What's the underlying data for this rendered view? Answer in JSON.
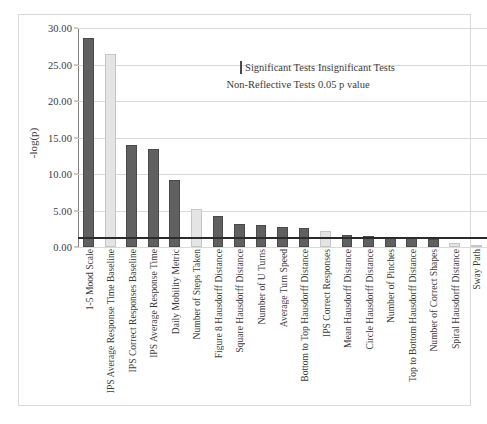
{
  "chart_data": {
    "type": "bar",
    "title": "",
    "xlabel": "",
    "ylabel": "-log(p)",
    "ylim": [
      0,
      30
    ],
    "yticks": [
      "0.00",
      "5.00",
      "10.00",
      "15.00",
      "20.00",
      "25.00",
      "30.00"
    ],
    "ytick_values": [
      0,
      5,
      10,
      15,
      20,
      25,
      30
    ],
    "grid": "horizontal",
    "legend_position": "top-center-inside",
    "threshold_line": {
      "label": "0.05 p value",
      "value": 1.3,
      "color": "#2b2b2b"
    },
    "colors": {
      "significant": "#606060",
      "insignificant": "#e4e4e4",
      "non_reflective": "#e4e4e4",
      "threshold": "#2b2b2b",
      "grid": "#d9d9d9"
    },
    "categories": [
      "1-5 Mood Scale",
      "IPS Average Response Time Baseline",
      "IPS Correct Responses Baseline",
      "IPS Average Response Time",
      "Daily Mobility Metric",
      "Number of Steps Taken",
      "Figure 8 Hausdorff Distance",
      "Square Hausdorff Distance",
      "Number of U Turns",
      "Average Turn Speed",
      "Bottom to Top Hausdorff Distance",
      "IPS Correct Responses",
      "Mean Hausdorff Distance",
      "Circle Hausdorff Distance",
      "Number of Pinches",
      "Top to Bottom Hausdorff Distance",
      "Number of Correct Shapes",
      "Spiral Hausdorff Distance",
      "Sway Path"
    ],
    "values": [
      28.6,
      26.4,
      14.0,
      13.4,
      9.2,
      5.2,
      4.3,
      3.2,
      3.0,
      2.8,
      2.6,
      2.2,
      1.7,
      1.5,
      1.3,
      1.2,
      1.1,
      0.6,
      0.15
    ],
    "point_classes": [
      "significant",
      "insignificant",
      "significant",
      "significant",
      "significant",
      "insignificant",
      "significant",
      "significant",
      "significant",
      "significant",
      "significant",
      "insignificant",
      "significant",
      "significant",
      "significant",
      "significant",
      "significant",
      "insignificant",
      "insignificant"
    ]
  },
  "legend": {
    "entries": [
      {
        "label": "Significant Tests",
        "marker": "box-dark"
      },
      {
        "label": "Insignificant Tests",
        "marker": "line-light"
      },
      {
        "label": "Non-Reflective Tests",
        "marker": "line-light"
      },
      {
        "label": "0.05 p value",
        "marker": "line-dark"
      }
    ]
  }
}
